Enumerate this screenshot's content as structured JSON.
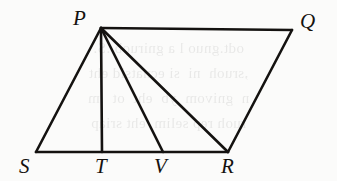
{
  "figure": {
    "caption": "Geometric figure: parallelogram-like quadrilateral PQRS with cevians from P to T, V and R",
    "stroke_color": "#141210",
    "background_color": "#fbfbfa",
    "stroke_width": 2.6,
    "points": {
      "S": {
        "label": "S",
        "x": 36,
        "y": 152
      },
      "T": {
        "label": "T",
        "x": 102,
        "y": 152
      },
      "V": {
        "label": "V",
        "x": 163,
        "y": 152
      },
      "R": {
        "label": "R",
        "x": 228,
        "y": 152
      },
      "P": {
        "label": "P",
        "x": 101,
        "y": 28
      },
      "Q": {
        "label": "Q",
        "x": 292,
        "y": 30
      }
    },
    "segments": [
      {
        "name": "SP",
        "from": "S",
        "to": "P"
      },
      {
        "name": "PQ",
        "from": "P",
        "to": "Q"
      },
      {
        "name": "QR",
        "from": "Q",
        "to": "R"
      },
      {
        "name": "SR",
        "from": "S",
        "to": "R"
      },
      {
        "name": "PT",
        "from": "P",
        "to": "T"
      },
      {
        "name": "PV",
        "from": "P",
        "to": "V"
      },
      {
        "name": "PR",
        "from": "P",
        "to": "R"
      }
    ],
    "labels": [
      {
        "name": "point-label-P",
        "text": "P",
        "x": 73,
        "y": 8
      },
      {
        "name": "point-label-Q",
        "text": "Q",
        "x": 300,
        "y": 11
      },
      {
        "name": "point-label-S",
        "text": "S",
        "x": 19,
        "y": 156
      },
      {
        "name": "point-label-T",
        "text": "T",
        "x": 95,
        "y": 156
      },
      {
        "name": "point-label-V",
        "text": "V",
        "x": 154,
        "y": 156
      },
      {
        "name": "point-label-R",
        "text": "R",
        "x": 221,
        "y": 156
      }
    ]
  },
  "show_through": {
    "lines": [
      "odt.gnuo l a gniruob .S.",
      ",sruoh  ni  si ecnatsid eht",
      "n  gnivom  yb  eht  ot  .m",
      "ruoh rep selim  eht sriap"
    ]
  }
}
